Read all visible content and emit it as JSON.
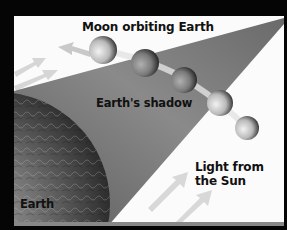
{
  "diagram": {
    "labels": {
      "moon_orbit": "Moon orbiting Earth",
      "shadow": "Earth's shadow",
      "sun_line1": "Light from",
      "sun_line2": "the Sun",
      "earth": "Earth"
    },
    "moons": [
      {
        "cx": 103,
        "cy": 50,
        "r": 14
      },
      {
        "cx": 145,
        "cy": 63,
        "r": 14
      },
      {
        "cx": 184,
        "cy": 80,
        "r": 13
      },
      {
        "cx": 220,
        "cy": 103,
        "r": 13
      },
      {
        "cx": 247,
        "cy": 128,
        "r": 12
      }
    ],
    "colors": {
      "border": "#050505",
      "background": "#fbfbfb",
      "shadow_dark": "#6e6e6e",
      "shadow_light": "#a8a8a8",
      "earth_dark": "#2a2a2a",
      "earth_light": "#9a9a9a",
      "arrow": "#cfcfcf",
      "text": "#111111"
    },
    "icons": [
      "orbit-direction-arrow",
      "sunlight-arrow",
      "sunlight-arrow",
      "sunlight-arrow",
      "sunlight-arrow"
    ]
  }
}
